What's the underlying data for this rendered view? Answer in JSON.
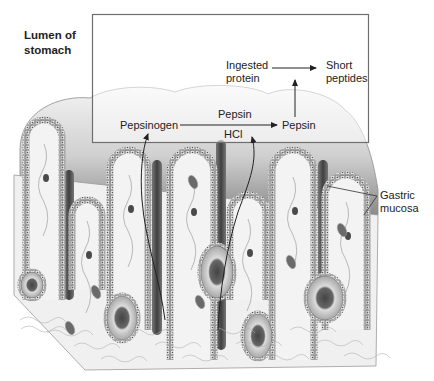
{
  "figure": {
    "labels": {
      "lumen": [
        "Lumen of",
        "stomach"
      ],
      "ingested_protein": [
        "Ingested",
        "protein"
      ],
      "short_peptides": [
        "Short",
        "peptides"
      ],
      "pepsinogen": "Pepsinogen",
      "pepsin_catalyst": "Pepsin",
      "hcl": "HCl",
      "pepsin_product": "Pepsin",
      "gastric_mucosa": [
        "Gastric",
        "mucosa"
      ]
    },
    "reactions": [
      {
        "from": "Pepsinogen",
        "to": "Pepsin",
        "catalysts": [
          "Pepsin",
          "HCl"
        ]
      },
      {
        "from": "Ingested protein",
        "to": "Short peptides",
        "catalyst": "Pepsin"
      }
    ],
    "colors": {
      "background": "#ffffff",
      "ink": "#222222",
      "box_stroke": "#6e6e6e",
      "tissue_light": "#efefef",
      "tissue_mid": "#b9b9b9",
      "tissue_dark": "#5a5a5a"
    }
  }
}
